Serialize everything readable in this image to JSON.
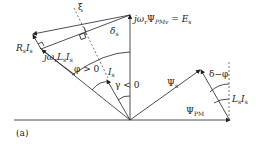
{
  "figure": {
    "panel_label": "(a)",
    "labels": {
      "xi": "ξ",
      "delta_s": "δ",
      "delta_s_sub": "s",
      "e_s_lhs": "jω",
      "e_s_lhs_sub": "r",
      "e_s_psi": "Ψ",
      "e_s_psi_sub": "PMv",
      "e_s_eq": " = ",
      "e_s_rhs": "E",
      "e_s_rhs_sub": "s",
      "rs_is": "R",
      "rs_is_sub": "s",
      "rs_is_i": "I",
      "rs_is_i_sub": "s",
      "jwl": "jω",
      "jwl_sub": "r",
      "jwl_l": "L",
      "jwl_l_sub": "s",
      "jwl_i": "I",
      "jwl_i_sub": "s",
      "phi_pos": "φ > 0",
      "i_s": "I",
      "i_s_sub": "s",
      "gamma_neg": "γ < 0",
      "psi_s": "Ψ",
      "psi_s_sub": "s",
      "delta_minus_phi": "δ−φ",
      "ls_is_l": "L",
      "ls_is_l_sub": "s",
      "ls_is_i": "I",
      "ls_is_i_sub": "s",
      "psi_pm": "Ψ",
      "psi_pm_sub": "PM"
    },
    "colors": {
      "line": "#222222",
      "dashed": "#555555",
      "background": "#ffffff"
    }
  }
}
